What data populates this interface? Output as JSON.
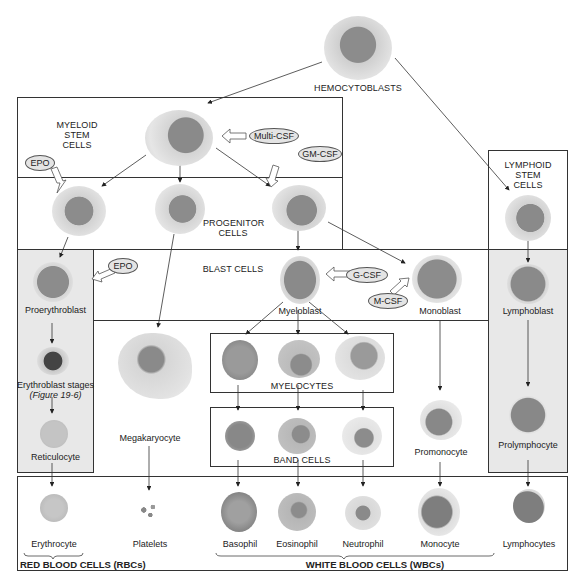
{
  "stages": {
    "hemocytoblasts": "HEMOCYTOBLASTS",
    "myeloid_stem": [
      "MYELOID",
      "STEM",
      "CELLS"
    ],
    "lymphoid_stem": [
      "LYMPHOID",
      "STEM",
      "CELLS"
    ],
    "progenitor": [
      "PROGENITOR",
      "CELLS"
    ],
    "blast": "BLAST CELLS",
    "myelocytes": "MYELOCYTES",
    "band_cells": "BAND CELLS"
  },
  "factors": {
    "multi_csf": "Multi-CSF",
    "gm_csf": "GM-CSF",
    "epo_top": "EPO",
    "epo_blast": "EPO",
    "g_csf": "G-CSF",
    "m_csf": "M-CSF"
  },
  "cells": {
    "proerythroblast": "Proerythroblast",
    "erythroblast_stages": "Erythroblast stages",
    "erythroblast_ref": "(Figure 19-6)",
    "reticulocyte": "Reticulocyte",
    "megakaryocyte": "Megakaryocyte",
    "myeloblast": "Myeloblast",
    "monoblast": "Monoblast",
    "lymphoblast": "Lymphoblast",
    "promonocyte": "Promonocyte",
    "prolymphocyte": "Prolymphocyte"
  },
  "mature": [
    {
      "label": "Erythrocyte"
    },
    {
      "label": "Platelets"
    },
    {
      "label": "Basophil"
    },
    {
      "label": "Eosinophil"
    },
    {
      "label": "Neutrophil"
    },
    {
      "label": "Monocyte"
    },
    {
      "label": "Lymphocytes"
    }
  ],
  "groups": {
    "rbc": "RED BLOOD CELLS (RBCs)",
    "wbc": "WHITE BLOOD CELLS (WBCs)"
  },
  "colors": {
    "line": "#333333",
    "shade": "#e8e8e8",
    "cytoplasm": "#d9d9d9",
    "nucleus": "#8a8a8a",
    "factor_fill": "#e4e4e4"
  }
}
